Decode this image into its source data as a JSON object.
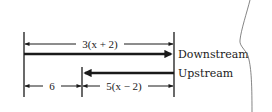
{
  "diagram": {
    "type": "distance-dimension-diagram",
    "labels": {
      "downstream": "Downstream",
      "upstream": "Upstream"
    },
    "dimensions": {
      "top": "3(x + 2)",
      "bottom_left": "6",
      "bottom_right": "5(x − 2)"
    },
    "arrows": [
      {
        "name": "downstream",
        "direction": "right",
        "style": "thick",
        "from": "left-boundary",
        "to": "right-boundary"
      },
      {
        "name": "upstream",
        "direction": "left",
        "style": "thick",
        "from": "right-boundary",
        "to": "middle-boundary"
      }
    ],
    "colors": {
      "ink": "#1a1a1a",
      "background": "#ffffff",
      "curve": "#777777"
    }
  }
}
